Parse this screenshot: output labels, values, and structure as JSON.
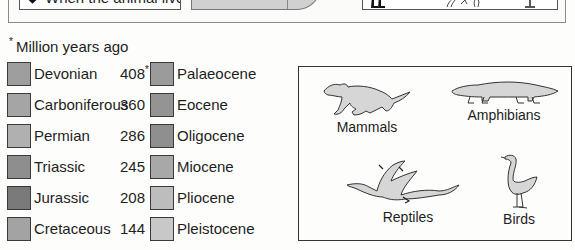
{
  "legend": {
    "when_label": "When the animal lived",
    "when_icon": "diamond-icon"
  },
  "footnote": {
    "marker": "*",
    "text": "Million years ago"
  },
  "periods_left": [
    {
      "name": "Devonian",
      "mya": "408",
      "marker": "*",
      "color": "#9e9e9e"
    },
    {
      "name": "Carboniferous",
      "mya": "360",
      "marker": "",
      "color": "#a5a5a5"
    },
    {
      "name": "Permian",
      "mya": "286",
      "marker": "",
      "color": "#b0b0b0"
    },
    {
      "name": "Triassic",
      "mya": "245",
      "marker": "",
      "color": "#8e8e8e"
    },
    {
      "name": "Jurassic",
      "mya": "208",
      "marker": "",
      "color": "#7a7a7a"
    },
    {
      "name": "Cretaceous",
      "mya": "144",
      "marker": "",
      "color": "#a3a3a3"
    }
  ],
  "periods_right": [
    {
      "name": "Palaeocene",
      "mya": "66",
      "color": "#9b9b9b"
    },
    {
      "name": "Eocene",
      "mya": "55",
      "color": "#949494"
    },
    {
      "name": "Oligocene",
      "mya": "37",
      "color": "#8f8f8f"
    },
    {
      "name": "Miocene",
      "mya": "25",
      "color": "#a8a8a8"
    },
    {
      "name": "Pliocene",
      "mya": "5",
      "color": "#bdbdbd"
    },
    {
      "name": "Pleistocene",
      "mya": "2",
      "color": "#c8c8c8"
    }
  ],
  "animals": {
    "mammals": {
      "label": "Mammals",
      "icon": "mammal-icon"
    },
    "amphibians": {
      "label": "Amphibians",
      "icon": "amphibian-icon"
    },
    "reptiles": {
      "label": "Reptiles",
      "icon": "pterosaur-icon"
    },
    "birds": {
      "label": "Birds",
      "icon": "bird-icon"
    }
  },
  "colors": {
    "outline": "#333333",
    "silhouette_fill": "#d6d6d6"
  }
}
